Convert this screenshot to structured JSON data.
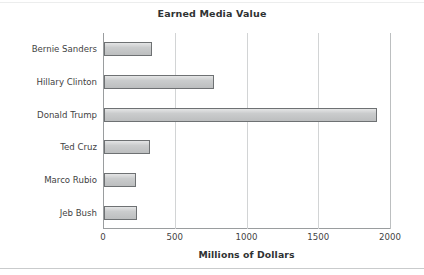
{
  "chart_data": {
    "type": "bar",
    "orientation": "horizontal",
    "title": "Earned Media Value",
    "xlabel": "Millions of Dollars",
    "ylabel": "",
    "categories": [
      "Bernie Sanders",
      "Hillary Clinton",
      "Donald Trump",
      "Ted Cruz",
      "Marco Rubio",
      "Jeb Bush"
    ],
    "values": [
      335,
      770,
      1900,
      320,
      225,
      230
    ],
    "xlim": [
      0,
      2000
    ],
    "xticks": [
      0,
      500,
      1000,
      1500,
      2000
    ],
    "xtick_labels": [
      "0",
      "500",
      "1000",
      "1500",
      "2000"
    ],
    "grid": "vertical",
    "legend": null,
    "bar_fill_color": "#c4c6c7",
    "bar_edge_color": "#6e7173",
    "axis_color": "#9a9d9f",
    "grid_color": "#d2d4d5",
    "text_color": "#3f4243"
  }
}
